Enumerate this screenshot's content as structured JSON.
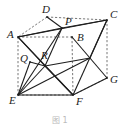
{
  "figure": {
    "type": "cube-geometry-diagram",
    "caption": "图 1",
    "vertices": [
      {
        "name": "A",
        "x": 18,
        "y": 37,
        "label_dx": -11,
        "label_dy": 1
      },
      {
        "name": "D",
        "x": 47,
        "y": 17,
        "label_dx": -5,
        "label_dy": -4
      },
      {
        "name": "P",
        "x": 62,
        "y": 28,
        "label_dx": 3,
        "label_dy": -3
      },
      {
        "name": "C",
        "x": 107,
        "y": 20,
        "label_dx": 3,
        "label_dy": -2
      },
      {
        "name": "B",
        "x": 72,
        "y": 37,
        "label_dx": 5,
        "label_dy": 4
      },
      {
        "name": "Q",
        "x": 30,
        "y": 62,
        "label_dx": -10,
        "label_dy": 0
      },
      {
        "name": "R",
        "x": 45,
        "y": 66,
        "label_dx": -4,
        "label_dy": -7
      },
      {
        "name": "E",
        "x": 18,
        "y": 95,
        "label_dx": -9,
        "label_dy": 9
      },
      {
        "name": "F",
        "x": 73,
        "y": 95,
        "label_dx": 3,
        "label_dy": 10
      },
      {
        "name": "G",
        "x": 107,
        "y": 78,
        "label_dx": 3,
        "label_dy": 5
      }
    ],
    "helper_points": {
      "M": {
        "x": 90,
        "y": 58
      }
    },
    "solid_edges": [
      [
        "A",
        "P"
      ],
      [
        "D",
        "P"
      ],
      [
        "A",
        "C"
      ],
      [
        "P",
        "C"
      ],
      [
        "A",
        "R"
      ],
      [
        "A",
        "F"
      ],
      [
        "P",
        "R"
      ],
      [
        "P",
        "E"
      ],
      [
        "B",
        "G"
      ],
      [
        "C",
        "M"
      ],
      [
        "C",
        "F"
      ],
      [
        "R",
        "M"
      ],
      [
        "E",
        "R"
      ],
      [
        "E",
        "F"
      ],
      [
        "E",
        "M"
      ],
      [
        "R",
        "F"
      ],
      [
        "F",
        "G"
      ],
      [
        "Q",
        "E"
      ],
      [
        "Q",
        "R"
      ]
    ],
    "dashed_edges": [
      [
        "D",
        "C"
      ],
      [
        "A",
        "B"
      ],
      [
        "B",
        "F"
      ],
      [
        "A",
        "E"
      ],
      [
        "E",
        "F"
      ],
      [
        "C",
        "G"
      ],
      [
        "F",
        "G"
      ],
      [
        "D",
        "A"
      ]
    ]
  }
}
